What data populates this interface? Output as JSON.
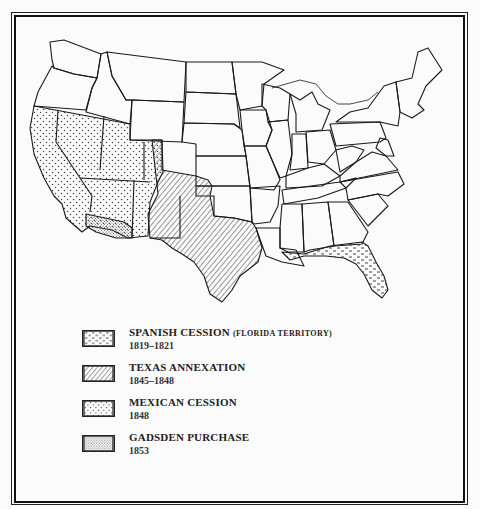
{
  "map": {
    "subject": "Territorial acquisitions of the United States, 1819-1853",
    "regions": [
      {
        "id": "spanish-cession",
        "pattern": "dashes",
        "states": [
          "Florida",
          "Gulf coast strip (Alabama, Mississippi, Louisiana)"
        ]
      },
      {
        "id": "texas-annexation",
        "pattern": "diagonal-hatch",
        "states": [
          "Texas",
          "parts of New Mexico, Oklahoma panhandle, Kansas, Colorado, Wyoming"
        ]
      },
      {
        "id": "mexican-cession",
        "pattern": "sparse-dots",
        "states": [
          "California",
          "Nevada",
          "Utah",
          "Arizona",
          "parts of New Mexico, Colorado, Wyoming"
        ]
      },
      {
        "id": "gadsden-purchase",
        "pattern": "dense-dots",
        "states": [
          "southern Arizona",
          "southwestern New Mexico"
        ]
      }
    ]
  },
  "legend": {
    "items": [
      {
        "title": "SPANISH CESSION",
        "subtitle": "(FLORIDA TERRITORY)",
        "years": "1819–1821",
        "pattern": "dashes"
      },
      {
        "title": "TEXAS ANNEXATION",
        "subtitle": "",
        "years": "1845–1848",
        "pattern": "diagonal-hatch"
      },
      {
        "title": "MEXICAN CESSION",
        "subtitle": "",
        "years": "1848",
        "pattern": "sparse-dots"
      },
      {
        "title": "GADSDEN PURCHASE",
        "subtitle": "",
        "years": "1853",
        "pattern": "dense-dots"
      }
    ]
  },
  "colors": {
    "ink": "#1a1a1a",
    "paper": "#fbfbfb"
  }
}
